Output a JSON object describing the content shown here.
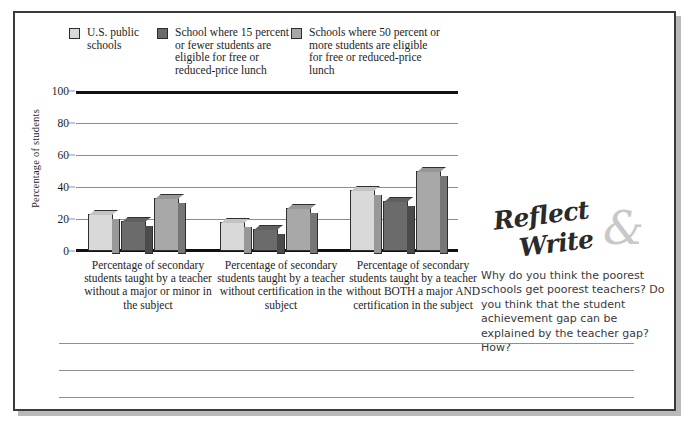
{
  "legend": {
    "items": [
      {
        "label": "U.S. public schools",
        "color": "#d9d9d9",
        "icon": "legend-swatch"
      },
      {
        "label": "School where 15 percent or fewer students are eligible for free or reduced-price lunch",
        "color": "#6b6b6b",
        "icon": "legend-swatch"
      },
      {
        "label": "Schools where 50 percent or more students are eligible for free or reduced-price lunch",
        "color": "#a8a8a8",
        "icon": "legend-swatch"
      }
    ]
  },
  "chart_data": {
    "type": "bar",
    "title": "",
    "xlabel": "",
    "ylabel": "Percentage of students",
    "ylim": [
      0,
      100
    ],
    "yticks": [
      0,
      20,
      40,
      60,
      80,
      100
    ],
    "grid": true,
    "legend_position": "top",
    "categories": [
      "Percentage of secondary students taught by a teacher without a major or minor in the subject",
      "Percentage of secondary students taught by a teacher without certification in the subject",
      "Percentage of secondary students taught by a teacher without BOTH a major AND certification in the subject"
    ],
    "series": [
      {
        "name": "U.S. public schools",
        "color": "#d9d9d9",
        "values": [
          23,
          18,
          38
        ]
      },
      {
        "name": "School where 15 percent or fewer students are eligible for free or reduced-price lunch",
        "color": "#6b6b6b",
        "values": [
          19,
          14,
          31
        ]
      },
      {
        "name": "Schools where 50 percent or more students are eligible for free or reduced-price lunch",
        "color": "#a8a8a8",
        "values": [
          33,
          27,
          50
        ]
      }
    ]
  },
  "reflect_write": {
    "word_reflect": "Reflect",
    "word_ampersand": "&",
    "word_write": "Write",
    "question": "Why do you think the poorest schools get poorest teachers? Do you think that the student achievement gap can be explained by the teacher gap? How?"
  },
  "writing_lines": {
    "count": 3
  }
}
